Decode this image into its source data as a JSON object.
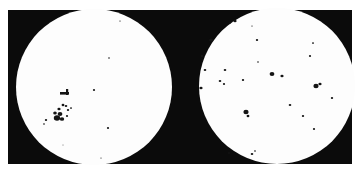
{
  "figure": {
    "background_color": "#0b0b0b",
    "disc_color": "#fdfdfd",
    "spot_color": "#151515"
  },
  "discs": [
    {
      "name": "left-solar-disc",
      "cx": 94,
      "cy": 87,
      "r": 78,
      "spots": [
        {
          "x": 57,
          "y": 118,
          "r": 3.2
        },
        {
          "x": 60,
          "y": 114,
          "r": 2.4
        },
        {
          "x": 55,
          "y": 113,
          "r": 1.8
        },
        {
          "x": 62,
          "y": 119,
          "r": 2.2
        },
        {
          "x": 59,
          "y": 109,
          "r": 1.6
        },
        {
          "x": 63,
          "y": 105,
          "r": 1.4
        },
        {
          "x": 66,
          "y": 106,
          "r": 1.3
        },
        {
          "x": 68,
          "y": 110,
          "r": 1.2
        },
        {
          "x": 71,
          "y": 108,
          "r": 1.0
        },
        {
          "x": 67,
          "y": 116,
          "r": 1.1
        },
        {
          "x": 46,
          "y": 120,
          "r": 1.2
        },
        {
          "x": 44,
          "y": 124,
          "r": 0.9
        },
        {
          "x": 94,
          "y": 90,
          "r": 1.1
        },
        {
          "x": 108,
          "y": 128,
          "r": 1.1
        },
        {
          "x": 109,
          "y": 58,
          "r": 0.8
        },
        {
          "x": 120,
          "y": 21,
          "r": 0.7
        },
        {
          "x": 101,
          "y": 158,
          "r": 0.6
        },
        {
          "x": 63,
          "y": 145,
          "r": 0.5
        }
      ],
      "bars": [
        {
          "x": 60,
          "y": 92,
          "w": 9,
          "h": 2.6
        },
        {
          "x": 66,
          "y": 89,
          "w": 2.2,
          "h": 6
        }
      ]
    },
    {
      "name": "right-solar-disc",
      "cx": 277,
      "cy": 86,
      "r": 78,
      "spots": [
        {
          "x": 235,
          "y": 21,
          "r": 1.6
        },
        {
          "x": 230,
          "y": 23,
          "r": 0.8
        },
        {
          "x": 211,
          "y": 40,
          "r": 1.8
        },
        {
          "x": 257,
          "y": 40,
          "r": 1.2
        },
        {
          "x": 252,
          "y": 26,
          "r": 0.7
        },
        {
          "x": 313,
          "y": 43,
          "r": 1.0
        },
        {
          "x": 202,
          "y": 56,
          "r": 1.3
        },
        {
          "x": 310,
          "y": 56,
          "r": 1.1
        },
        {
          "x": 205,
          "y": 70,
          "r": 1.3
        },
        {
          "x": 225,
          "y": 70,
          "r": 1.3
        },
        {
          "x": 258,
          "y": 62,
          "r": 0.8
        },
        {
          "x": 272,
          "y": 74,
          "r": 2.4
        },
        {
          "x": 282,
          "y": 76,
          "r": 1.6
        },
        {
          "x": 243,
          "y": 80,
          "r": 1.2
        },
        {
          "x": 220,
          "y": 81,
          "r": 1.3
        },
        {
          "x": 224,
          "y": 84,
          "r": 1.1
        },
        {
          "x": 201,
          "y": 88,
          "r": 1.6
        },
        {
          "x": 316,
          "y": 86,
          "r": 2.6
        },
        {
          "x": 320,
          "y": 84,
          "r": 1.6
        },
        {
          "x": 332,
          "y": 98,
          "r": 1.2
        },
        {
          "x": 290,
          "y": 105,
          "r": 1.3
        },
        {
          "x": 246,
          "y": 112,
          "r": 2.6
        },
        {
          "x": 248,
          "y": 116,
          "r": 1.4
        },
        {
          "x": 303,
          "y": 116,
          "r": 1.2
        },
        {
          "x": 314,
          "y": 129,
          "r": 1.1
        },
        {
          "x": 229,
          "y": 153,
          "r": 1.0
        },
        {
          "x": 252,
          "y": 154,
          "r": 1.3
        },
        {
          "x": 255,
          "y": 151,
          "r": 0.9
        },
        {
          "x": 197,
          "y": 86,
          "r": 0.6
        }
      ],
      "bars": []
    }
  ]
}
